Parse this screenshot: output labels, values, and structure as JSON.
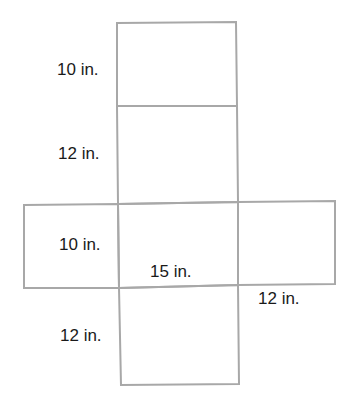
{
  "diagram": {
    "type": "net of rectangular prism",
    "line_color": "#a8a8a8",
    "labels": {
      "top_face_height": "10 in.",
      "front_face_height": "12 in.",
      "side_face_height": "10 in.",
      "base_width": "15 in.",
      "right_face_width": "12 in.",
      "bottom_face_height": "12 in."
    }
  }
}
